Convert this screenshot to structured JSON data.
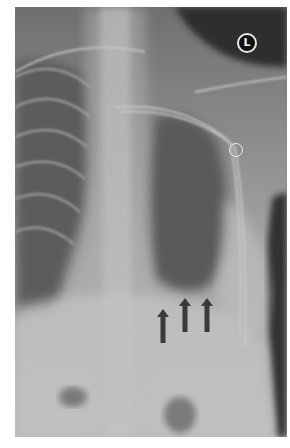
{
  "image": {
    "type": "chest-xray",
    "orientation_marker": "L",
    "colors": {
      "frame": "#ffffff",
      "film_mid": "#8e8e8e",
      "arrows": "#3a3a3a",
      "marker_bg": "#111111"
    }
  },
  "annotations": {
    "arrows": [
      {
        "name": "arrow-1",
        "x": 142,
        "y": 302
      },
      {
        "name": "arrow-2",
        "x": 164,
        "y": 291
      },
      {
        "name": "arrow-3",
        "x": 186,
        "y": 291
      }
    ],
    "ring": {
      "name": "ring-marker",
      "x": 214,
      "y": 136
    }
  }
}
